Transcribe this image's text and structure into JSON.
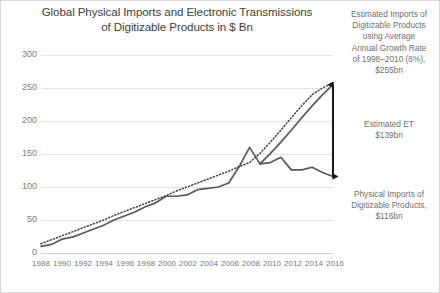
{
  "chart_data": {
    "type": "line",
    "title": "Global Physical Imports and Electronic Transmissions\nof Digitizable Products in $ Bn",
    "xlabel": "",
    "ylabel": "",
    "ylim": [
      0,
      300
    ],
    "yticks": [
      0,
      50,
      100,
      150,
      200,
      250,
      300
    ],
    "xlim": [
      1988,
      2016
    ],
    "xticks": [
      1988,
      1990,
      1992,
      1994,
      1996,
      1998,
      2000,
      2002,
      2004,
      2006,
      2008,
      2010,
      2012,
      2014,
      2016
    ],
    "grid": true,
    "legend": "none",
    "x": [
      1988,
      1989,
      1990,
      1991,
      1992,
      1993,
      1994,
      1995,
      1996,
      1997,
      1998,
      1999,
      2000,
      2001,
      2002,
      2003,
      2004,
      2005,
      2006,
      2007,
      2008,
      2009,
      2010,
      2011,
      2012,
      2013,
      2014,
      2015,
      2016
    ],
    "series": [
      {
        "name": "Physical Imports of Digitizable Products (actual)",
        "style": "solid",
        "color": "#595959",
        "values": [
          10,
          13,
          21,
          24,
          30,
          36,
          42,
          50,
          56,
          62,
          70,
          76,
          86,
          86,
          88,
          96,
          98,
          100,
          106,
          131,
          160,
          135,
          137,
          145,
          126,
          126,
          130,
          122,
          116
        ]
      },
      {
        "name": "Estimated Imports of Digitizable Products using Average Annual Growth Rate of 1998-2010 (8%)",
        "style": "solid",
        "color": "#595959",
        "values": [
          null,
          null,
          null,
          null,
          null,
          null,
          null,
          null,
          null,
          null,
          null,
          null,
          null,
          null,
          null,
          null,
          null,
          null,
          null,
          null,
          null,
          135,
          151,
          168,
          186,
          205,
          223,
          240,
          255
        ]
      },
      {
        "name": "Trend line",
        "style": "dotted",
        "color": "#404040",
        "values": [
          14,
          20,
          26,
          32,
          38,
          44,
          50,
          57,
          63,
          69,
          75,
          81,
          87,
          94,
          100,
          106,
          112,
          118,
          124,
          131,
          137,
          151,
          168,
          186,
          205,
          223,
          240,
          250,
          258
        ]
      }
    ],
    "annotations": [
      {
        "name": "estimated-imports",
        "text": "Estimated Imports of\nDigitizable Products\nusing Average\nAnnual Growth Rate\nof 1998–2010 (8%),\n$255bn",
        "value": 255,
        "year": 2016
      },
      {
        "name": "estimated-et",
        "text": "Estimated ET\n$139bn",
        "value": 139,
        "year": 2016
      },
      {
        "name": "physical-imports",
        "text": "Physical Imports of\nDigitizable Products,\n$116bn",
        "value": 116,
        "year": 2016
      }
    ],
    "arrow": {
      "name": "gap-arrow",
      "year": 2016,
      "from_value": 255,
      "to_value": 116,
      "color": "#1a1a1a",
      "double_headed": true
    }
  },
  "axes": {
    "y_ticks": [
      "300",
      "250",
      "200",
      "150",
      "100",
      "50",
      "0"
    ],
    "x_ticks": [
      "1988",
      "1990",
      "1992",
      "1994",
      "1996",
      "1998",
      "2000",
      "2002",
      "2004",
      "2006",
      "2008",
      "2010",
      "2012",
      "2014",
      "2016"
    ]
  },
  "title": {
    "line1": "Global Physical Imports and Electronic Transmissions",
    "line2": "of Digitizable Products in $ Bn",
    "full": "Global Physical Imports and Electronic Transmissions\nof Digitizable Products in $ Bn"
  },
  "annotations": {
    "estimated_imports": "Estimated Imports of\nDigitizable Products\nusing Average\nAnnual Growth Rate\nof 1998–2010 (8%),\n$255bn",
    "estimated_et": "Estimated ET\n$139bn",
    "physical_imports": "Physical Imports of\nDigitizable Products,\n$116bn"
  },
  "colors": {
    "series_line": "#595959",
    "trend_line": "#404040",
    "arrow": "#1a1a1a",
    "gridline": "#e2e2e2",
    "text": "#6f6f6f",
    "title": "#404040"
  }
}
